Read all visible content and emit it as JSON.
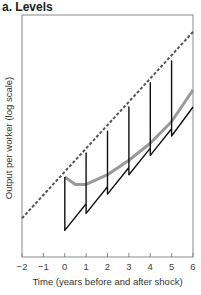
{
  "panel": {
    "title": "a. Levels"
  },
  "axes": {
    "xlabel": "Time (years before and after shock)",
    "ylabel": "Output per worker (log scale)"
  },
  "chart_data": {
    "type": "line",
    "title": "a. Levels",
    "xlabel": "Time (years before and after shock)",
    "ylabel": "Output per worker (log scale)",
    "xlim": [
      -2,
      6
    ],
    "xticks": [
      -2,
      -1,
      0,
      1,
      2,
      3,
      4,
      5,
      6
    ],
    "ylim": [
      0,
      1
    ],
    "yticks": [],
    "grid": false,
    "legend": null,
    "series": [
      {
        "name": "Pre-shock trend (dashed)",
        "style": "dashed",
        "color": "#555555",
        "x": [
          -2,
          6
        ],
        "y": [
          0.16,
          0.93
        ]
      },
      {
        "name": "Output path with repeated shocks (sawtooth)",
        "style": "solid",
        "color": "#111111",
        "x": [
          0,
          0,
          1,
          1,
          1,
          2,
          2,
          2,
          3,
          3,
          3,
          4,
          4,
          4,
          5,
          5,
          5,
          6
        ],
        "y": [
          0.33,
          0.11,
          0.22,
          0.43,
          0.18,
          0.29,
          0.52,
          0.26,
          0.37,
          0.62,
          0.34,
          0.45,
          0.72,
          0.42,
          0.53,
          0.81,
          0.5,
          0.62
        ]
      },
      {
        "name": "Average path (gray)",
        "style": "solid-thick",
        "color": "#999999",
        "x": [
          0,
          0.5,
          1,
          2,
          3,
          4,
          5,
          6
        ],
        "y": [
          0.33,
          0.3,
          0.3,
          0.34,
          0.4,
          0.47,
          0.56,
          0.69
        ]
      }
    ]
  },
  "colors": {
    "axis": "#777777",
    "trend": "#555555",
    "sawtooth": "#111111",
    "average": "#9a9a9a"
  }
}
